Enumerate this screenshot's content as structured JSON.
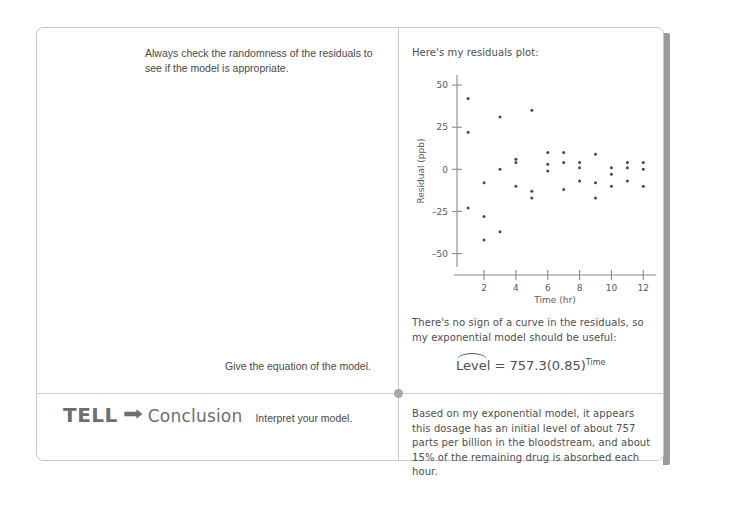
{
  "left_column": {
    "prompt_residuals": "Always check the randomness of the residuals to see if the model is appropriate.",
    "prompt_equation": "Give the equation of the model.",
    "tell_step": {
      "step_word": "TELL",
      "arrow_icon": "right-arrow-icon",
      "heading": "Conclusion",
      "instruction": "Interpret your model."
    }
  },
  "right_column": {
    "intro": "Here's my residuals plot:",
    "no_curve_note": "There's no sign of a curve in the residuals, so my exponential model should be useful:",
    "equation": {
      "response_var": "Level",
      "equals": "=",
      "coefficient": "757.3",
      "open_paren": "(",
      "base": "0.85",
      "close_paren": ")",
      "exponent": "Time",
      "full_text": "Level = 757.3(0.85)^Time"
    },
    "conclusion": "Based on my exponential model, it appears this dosage has an initial level of about 757 parts per billion in the bloodstream, and about 15% of the remaining drug is absorbed each hour."
  },
  "colors": {
    "ink": "#4e4e4e",
    "rule": "#cccccc",
    "heading_gray": "#6e6e6e",
    "page_border": "#c9c9c9",
    "page_shadow": "#9b9b9b",
    "point": "#4a4a4a"
  },
  "chart_data": {
    "type": "scatter",
    "title": "",
    "xlabel": "Time (hr)",
    "ylabel": "Residual (ppb)",
    "xlim": [
      0.3,
      12.8
    ],
    "ylim": [
      -58,
      56
    ],
    "xticks": [
      2,
      4,
      6,
      8,
      10,
      12
    ],
    "yticks": [
      50,
      25,
      0,
      -25,
      -50
    ],
    "grid": false,
    "legend": false,
    "points": [
      {
        "x": 1.0,
        "y": 42
      },
      {
        "x": 1.0,
        "y": 22
      },
      {
        "x": 1.0,
        "y": -23
      },
      {
        "x": 2.0,
        "y": -8
      },
      {
        "x": 2.0,
        "y": -28
      },
      {
        "x": 2.0,
        "y": -42
      },
      {
        "x": 3.0,
        "y": 31
      },
      {
        "x": 3.0,
        "y": 0
      },
      {
        "x": 3.0,
        "y": -37
      },
      {
        "x": 4.0,
        "y": 6
      },
      {
        "x": 4.0,
        "y": 4
      },
      {
        "x": 4.0,
        "y": -10
      },
      {
        "x": 5.0,
        "y": 35
      },
      {
        "x": 5.0,
        "y": -13
      },
      {
        "x": 5.0,
        "y": -17
      },
      {
        "x": 6.0,
        "y": 10
      },
      {
        "x": 6.0,
        "y": 3
      },
      {
        "x": 6.0,
        "y": -1
      },
      {
        "x": 7.0,
        "y": 10
      },
      {
        "x": 7.0,
        "y": 4
      },
      {
        "x": 7.0,
        "y": -12
      },
      {
        "x": 8.0,
        "y": 4
      },
      {
        "x": 8.0,
        "y": 1
      },
      {
        "x": 8.0,
        "y": -7
      },
      {
        "x": 9.0,
        "y": 9
      },
      {
        "x": 9.0,
        "y": -8
      },
      {
        "x": 9.0,
        "y": -17
      },
      {
        "x": 10.0,
        "y": 1
      },
      {
        "x": 10.0,
        "y": -3
      },
      {
        "x": 10.0,
        "y": -10
      },
      {
        "x": 11.0,
        "y": 4
      },
      {
        "x": 11.0,
        "y": 1
      },
      {
        "x": 11.0,
        "y": -7
      },
      {
        "x": 12.0,
        "y": 4
      },
      {
        "x": 12.0,
        "y": 0
      },
      {
        "x": 12.0,
        "y": -10
      }
    ]
  }
}
